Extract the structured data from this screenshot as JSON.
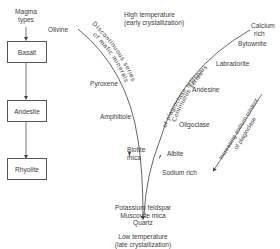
{
  "magma": {
    "title_line1": "Magma",
    "title_line2": "types",
    "types": [
      "Basalt",
      "Andesite",
      "Rhyolite"
    ]
  },
  "header": {
    "line1": "High temperature",
    "line2": "(early crystallization)"
  },
  "footer": {
    "line1": "Low temperature",
    "line2": "(late crystallization)"
  },
  "discontinuous": {
    "series_label_line1": "Discontinuous series",
    "series_label_line2": "of mafic minerals",
    "minerals": [
      "Olivine",
      "Pyroxene",
      "Amphibole",
      "Biotite",
      "mica"
    ]
  },
  "continuous": {
    "series_label_line1": "Continuous series",
    "series_label_line2": "of plagioclase feldspars",
    "calcium_line1": "Calcium",
    "calcium_line2": "rich",
    "minerals": [
      "Bytownite",
      "Labradorite",
      "Andesine",
      "Oligoclase",
      "Albite"
    ],
    "sodium": "Sodium rich",
    "trend_line1": "Increasing sodium content",
    "trend_line2": "of plagioclase"
  },
  "end_products": [
    "Potassium feldspar",
    "Muscovite mica",
    "Quartz"
  ],
  "colors": {
    "line": "#555555",
    "text": "#404040",
    "background": "#ffffff"
  }
}
